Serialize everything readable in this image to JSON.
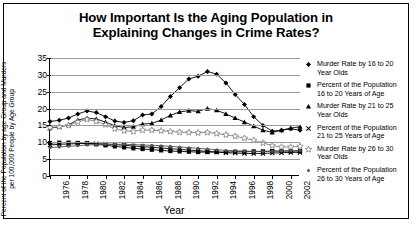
{
  "chart_data": {
    "type": "line",
    "title": "How Important Is the Aging Population in Explaining Changes in Crime Rates?",
    "title_line1": "How Important Is the Aging Population in",
    "title_line2": "Explaining Changes in Crime Rates?",
    "xlabel": "Year",
    "ylabel": "Percent of the Population by age Group and Murders per 100,000 People by Age Group",
    "ylabel_line1": "Percent of the Population by age Group and Murders",
    "ylabel_line2": "per 100,000 People by Age Group",
    "ylim": [
      0,
      35
    ],
    "yticks": [
      0,
      5,
      10,
      15,
      20,
      25,
      30,
      35
    ],
    "xlim": [
      1976,
      2003
    ],
    "xticks": [
      1976,
      1978,
      1980,
      1982,
      1984,
      1986,
      1988,
      1990,
      1992,
      1994,
      1996,
      1998,
      2000,
      2002
    ],
    "x": [
      1976,
      1977,
      1978,
      1979,
      1980,
      1981,
      1982,
      1983,
      1984,
      1985,
      1986,
      1987,
      1988,
      1989,
      1990,
      1991,
      1992,
      1993,
      1994,
      1995,
      1996,
      1997,
      1998,
      1999,
      2000,
      2001,
      2002,
      2003
    ],
    "grid": true,
    "legend_position": "right",
    "series": [
      {
        "name": "Murder Rate by 16 to 20 Year Olds",
        "label_line1": "Murder Rate by 16 to 20",
        "label_line2": "Year Olds",
        "marker": "diamond",
        "color": "#000000",
        "values": [
          16.2,
          16.5,
          17.2,
          18.4,
          19.3,
          18.8,
          17.6,
          16.3,
          15.9,
          16.4,
          18.1,
          18.4,
          20.6,
          23.6,
          26.2,
          28.8,
          29.6,
          31.0,
          30.2,
          27.6,
          24.2,
          21.2,
          17.6,
          15.0,
          13.3,
          13.6,
          14.0,
          13.6
        ]
      },
      {
        "name": "Percent of the Population 16 to 20 Years of Age",
        "label_line1": "Percent of the Population",
        "label_line2": "16 to 20 Years of Age",
        "marker": "square",
        "color": "#000000",
        "values": [
          9.8,
          9.9,
          9.9,
          9.8,
          9.7,
          9.4,
          9.1,
          8.8,
          8.5,
          8.2,
          8.0,
          7.8,
          7.6,
          7.4,
          7.3,
          7.2,
          7.1,
          7.1,
          7.1,
          7.1,
          7.2,
          7.2,
          7.3,
          7.3,
          7.4,
          7.4,
          7.4,
          7.4
        ]
      },
      {
        "name": "Murder Rate by 21 to 25 Year Olds",
        "label_line1": "Murder Rate by 21 to 25",
        "label_line2": "Year Olds",
        "marker": "triangle",
        "color": "#000000",
        "values": [
          14.2,
          14.6,
          15.2,
          16.6,
          17.2,
          16.9,
          16.0,
          14.9,
          14.4,
          14.6,
          15.4,
          15.6,
          16.6,
          18.0,
          19.0,
          19.4,
          19.2,
          20.0,
          19.5,
          18.4,
          17.2,
          16.0,
          14.8,
          13.6,
          12.9,
          13.6,
          14.2,
          14.6
        ]
      },
      {
        "name": "Percent of the Population 21 to 25 Years of Age",
        "label_line1": "Percent of the Population",
        "label_line2": "21 to 25 Years of Age",
        "marker": "x",
        "color": "#000000",
        "values": [
          9.2,
          9.4,
          9.5,
          9.6,
          9.7,
          9.6,
          9.5,
          9.3,
          9.1,
          8.9,
          8.7,
          8.5,
          8.3,
          8.1,
          7.9,
          7.7,
          7.5,
          7.3,
          7.1,
          6.9,
          6.8,
          6.7,
          6.7,
          6.7,
          6.8,
          6.9,
          7.0,
          7.0
        ]
      },
      {
        "name": "Murder Rate by 26 to 30 Year Olds",
        "label_line1": "Murder Rate by 26 to 30",
        "label_line2": "Year Olds",
        "marker": "star",
        "color": "#808080",
        "values": [
          14.4,
          14.6,
          15.0,
          16.0,
          16.8,
          16.2,
          15.2,
          14.0,
          13.4,
          13.2,
          13.6,
          13.6,
          13.4,
          13.2,
          13.0,
          12.9,
          12.8,
          12.9,
          12.6,
          12.2,
          11.8,
          11.2,
          10.6,
          9.8,
          9.0,
          8.6,
          8.6,
          8.8
        ]
      },
      {
        "name": "Percent of the Population 26 to 30 Years of Age",
        "label_line1": "Percent of the Population",
        "label_line2": "26 to 30 Years of Age",
        "marker": "dot",
        "color": "#555555",
        "values": [
          8.4,
          8.6,
          8.8,
          9.0,
          9.2,
          9.3,
          9.4,
          9.4,
          9.4,
          9.3,
          9.2,
          9.1,
          9.0,
          8.8,
          8.6,
          8.4,
          8.2,
          8.0,
          7.8,
          7.6,
          7.5,
          7.4,
          7.3,
          7.3,
          7.3,
          7.4,
          7.5,
          7.6
        ]
      }
    ]
  }
}
